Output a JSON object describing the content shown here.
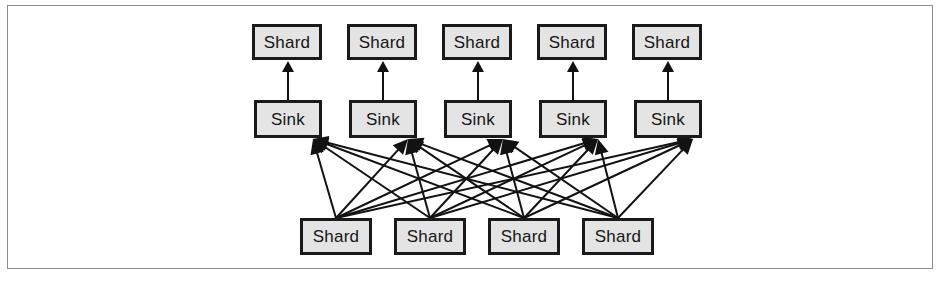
{
  "figure": {
    "width": 944,
    "height": 282,
    "background_color": "#ffffff",
    "frame": {
      "x": 7,
      "y": 5,
      "width": 926,
      "height": 264,
      "border_color": "#8d8d8d"
    }
  },
  "style": {
    "box_fill": "#e4e4e4",
    "box_border": "#1a1a1a",
    "box_border_width": 3,
    "edge_color": "#121212",
    "edge_width": 2,
    "text_color": "#151515",
    "font_size": 17
  },
  "diagram": {
    "type": "bipartite-flow",
    "rows": [
      {
        "id": "top-shards",
        "role": "destination",
        "label_text": "Shard",
        "count": 5,
        "y": 24,
        "box_width": 70,
        "box_height": 36,
        "x_positions": [
          252,
          347,
          442,
          537,
          632
        ],
        "nodes": [
          {
            "id": "top-shard-1",
            "label": "Shard"
          },
          {
            "id": "top-shard-2",
            "label": "Shard"
          },
          {
            "id": "top-shard-3",
            "label": "Shard"
          },
          {
            "id": "top-shard-4",
            "label": "Shard"
          },
          {
            "id": "top-shard-5",
            "label": "Shard"
          }
        ]
      },
      {
        "id": "sinks",
        "role": "sink",
        "label_text": "Sink",
        "count": 5,
        "y": 100,
        "box_width": 68,
        "box_height": 38,
        "x_positions": [
          254,
          349,
          444,
          539,
          634
        ],
        "nodes": [
          {
            "id": "sink-1",
            "label": "Sink"
          },
          {
            "id": "sink-2",
            "label": "Sink"
          },
          {
            "id": "sink-3",
            "label": "Sink"
          },
          {
            "id": "sink-4",
            "label": "Sink"
          },
          {
            "id": "sink-5",
            "label": "Sink"
          }
        ]
      },
      {
        "id": "bottom-shards",
        "role": "source",
        "label_text": "Shard",
        "count": 4,
        "y": 218,
        "box_width": 72,
        "box_height": 37,
        "x_positions": [
          300,
          394,
          488,
          582
        ],
        "nodes": [
          {
            "id": "bottom-shard-1",
            "label": "Shard"
          },
          {
            "id": "bottom-shard-2",
            "label": "Shard"
          },
          {
            "id": "bottom-shard-3",
            "label": "Shard"
          },
          {
            "id": "bottom-shard-4",
            "label": "Shard"
          }
        ]
      }
    ],
    "edges": {
      "sink_to_top_shard": {
        "description": "Each Sink sends one vertical arrow up into the Shard directly above it",
        "count": 5,
        "arrowhead": "filled-triangle",
        "direction": "upward"
      },
      "bottom_shard_to_sink": {
        "description": "Every bottom Shard fans out to all five Sinks (complete bipartite)",
        "count": 20,
        "arrowhead": "filled-triangle",
        "direction": "upward"
      }
    }
  }
}
